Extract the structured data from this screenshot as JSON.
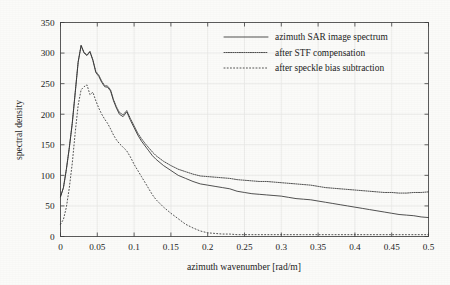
{
  "chart_data": {
    "type": "line",
    "title": "",
    "xlabel": "azimuth wavenumber [rad/m]",
    "ylabel": "spectral density",
    "xlim": [
      0,
      0.5
    ],
    "ylim": [
      0,
      350
    ],
    "grid": true,
    "legend_position": "top-right",
    "xticks": [
      "0",
      "0.05",
      "0.1",
      "0.15",
      "0.2",
      "0.25",
      "0.3",
      "0.35",
      "0.4",
      "0.45",
      "0.5"
    ],
    "xtick_values": [
      0,
      0.05,
      0.1,
      0.15,
      0.2,
      0.25,
      0.3,
      0.35,
      0.4,
      0.45,
      0.5
    ],
    "yticks": [
      "0",
      "50",
      "100",
      "150",
      "200",
      "250",
      "300",
      "350"
    ],
    "ytick_values": [
      0,
      50,
      100,
      150,
      200,
      250,
      300,
      350
    ],
    "x": [
      0,
      0.004,
      0.008,
      0.012,
      0.016,
      0.02,
      0.024,
      0.028,
      0.032,
      0.036,
      0.04,
      0.044,
      0.048,
      0.052,
      0.056,
      0.06,
      0.064,
      0.068,
      0.072,
      0.076,
      0.08,
      0.085,
      0.09,
      0.095,
      0.1,
      0.105,
      0.11,
      0.115,
      0.12,
      0.125,
      0.13,
      0.14,
      0.15,
      0.16,
      0.17,
      0.18,
      0.19,
      0.2,
      0.21,
      0.22,
      0.23,
      0.24,
      0.25,
      0.26,
      0.27,
      0.28,
      0.29,
      0.3,
      0.31,
      0.32,
      0.33,
      0.34,
      0.35,
      0.36,
      0.37,
      0.38,
      0.39,
      0.4,
      0.41,
      0.42,
      0.43,
      0.44,
      0.45,
      0.46,
      0.47,
      0.48,
      0.49,
      0.5
    ],
    "series": [
      {
        "name": "azimuth SAR image spectrum",
        "style": "solid",
        "values": [
          65,
          80,
          110,
          145,
          185,
          235,
          285,
          312,
          300,
          296,
          302,
          288,
          268,
          262,
          252,
          245,
          244,
          238,
          222,
          210,
          200,
          196,
          204,
          190,
          178,
          166,
          156,
          148,
          140,
          132,
          126,
          116,
          108,
          100,
          95,
          90,
          86,
          84,
          82,
          80,
          78,
          74,
          72,
          70,
          69,
          68,
          67,
          66,
          64,
          62,
          61,
          60,
          58,
          56,
          54,
          52,
          50,
          48,
          46,
          44,
          42,
          40,
          38,
          36,
          35,
          34,
          32,
          31
        ]
      },
      {
        "name": "after STF compensation",
        "style": "dotted-dense",
        "values": [
          65,
          80,
          110,
          146,
          186,
          236,
          286,
          313,
          301,
          297,
          303,
          289,
          270,
          264,
          254,
          247,
          246,
          240,
          224,
          212,
          203,
          199,
          206,
          193,
          181,
          169,
          160,
          152,
          145,
          138,
          132,
          123,
          116,
          110,
          106,
          102,
          99,
          98,
          97,
          96,
          95,
          93,
          92,
          91,
          90,
          90,
          89,
          88,
          87,
          86,
          85,
          84,
          82,
          80,
          79,
          78,
          77,
          76,
          75,
          74,
          73,
          72,
          72,
          71,
          71,
          72,
          72,
          73
        ]
      },
      {
        "name": "after speckle bias subtraction",
        "style": "dotted-sparse",
        "values": [
          20,
          28,
          48,
          80,
          120,
          170,
          215,
          240,
          245,
          248,
          232,
          236,
          222,
          210,
          200,
          192,
          185,
          176,
          166,
          158,
          152,
          146,
          140,
          130,
          118,
          108,
          98,
          88,
          78,
          68,
          60,
          48,
          38,
          29,
          20,
          14,
          9,
          6,
          5,
          4,
          4,
          3,
          3,
          3,
          3,
          3,
          3,
          3,
          3,
          3,
          3,
          3,
          3,
          3,
          3,
          3,
          3,
          3,
          3,
          3,
          3,
          3,
          3,
          3,
          3,
          3,
          3,
          3
        ]
      }
    ]
  },
  "legend": {
    "entries": [
      {
        "label": "azimuth SAR image spectrum"
      },
      {
        "label": "after STF compensation"
      },
      {
        "label": "after speckle bias subtraction"
      }
    ]
  },
  "colors": {
    "line": "#333333",
    "frame": "#4a4a4a",
    "grid": "#e9e9e6",
    "background": "#fbfbf9",
    "text": "#1c1c1c"
  }
}
